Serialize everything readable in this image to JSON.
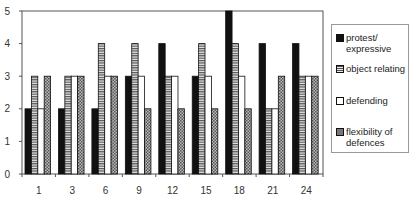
{
  "chart_data": {
    "type": "bar",
    "title": "",
    "xlabel": "",
    "ylabel": "",
    "ylim": [
      0,
      5
    ],
    "yticks": [
      0,
      1,
      2,
      3,
      4,
      5
    ],
    "grid": false,
    "legend_position": "right",
    "categories": [
      "1",
      "3",
      "6",
      "9",
      "12",
      "15",
      "18",
      "21",
      "24"
    ],
    "series": [
      {
        "name": "protest/ expressive",
        "pattern": "solid-black",
        "values": [
          2,
          2,
          2,
          3,
          4,
          3,
          5,
          4,
          4
        ]
      },
      {
        "name": "object relating",
        "pattern": "horizontal-stripes",
        "values": [
          3,
          3,
          4,
          4,
          3,
          4,
          4,
          2,
          3
        ]
      },
      {
        "name": "defending",
        "pattern": "white",
        "values": [
          2,
          3,
          3,
          3,
          3,
          3,
          3,
          2,
          3
        ]
      },
      {
        "name": "flexibility of defences",
        "pattern": "crosshatch-gray",
        "values": [
          3,
          3,
          3,
          2,
          2,
          2,
          2,
          3,
          3
        ]
      }
    ]
  },
  "legend": {
    "items": [
      {
        "label": "protest/ expressive"
      },
      {
        "label": "object relating"
      },
      {
        "label": "defending"
      },
      {
        "label": "flexibility of defences"
      }
    ]
  }
}
